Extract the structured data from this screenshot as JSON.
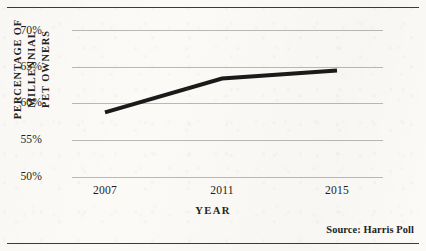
{
  "figure": {
    "background_color": "#fbfaf7",
    "rule_color": "#3b3a38",
    "source_note": "Source: Harris Poll"
  },
  "chart_data": {
    "type": "line",
    "title": "",
    "subtitle": "",
    "xlabel": "YEAR",
    "ylabel": "PERCENTAGE OF MILLENNIAL PET OWNERS",
    "ylabel_lines": [
      "PERCENTAGE OF MILLENNIAL",
      "PET OWNERS"
    ],
    "categories": [
      "2007",
      "2011",
      "2015"
    ],
    "x": [
      2007,
      2011,
      2015
    ],
    "values": [
      58.8,
      63.4,
      64.5
    ],
    "series": [
      {
        "name": "Percentage of millennial pet owners",
        "values": [
          58.8,
          63.4,
          64.5
        ],
        "color": "#1a1a1a",
        "line_width": 4
      }
    ],
    "ylim": [
      50,
      70
    ],
    "yticks": [
      70,
      65,
      60,
      55,
      50
    ],
    "ytick_labels": [
      "70%",
      "65%",
      "60%",
      "55%",
      "50%"
    ],
    "xtick_labels": [
      "2007",
      "2011",
      "2015"
    ],
    "grid": {
      "horizontal": true,
      "vertical": false,
      "color": "#b9b8b5"
    },
    "legend": {
      "visible": false,
      "position": "none"
    },
    "annotations": [
      "Source: Harris Poll"
    ]
  }
}
